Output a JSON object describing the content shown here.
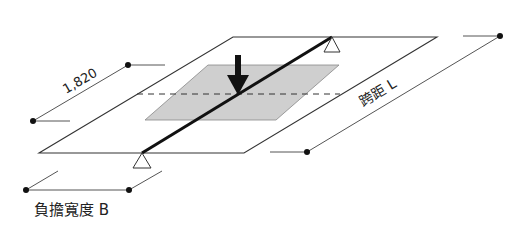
{
  "diagram": {
    "labels": {
      "width_dimension": "1,820",
      "span": "跨距 L",
      "tributary_width": "負擔寬度 B"
    },
    "colors": {
      "line": "#222222",
      "thin_line": "#555555",
      "beam": "#111111",
      "shaded_area": "#cfcfcf",
      "background": "#ffffff"
    }
  }
}
